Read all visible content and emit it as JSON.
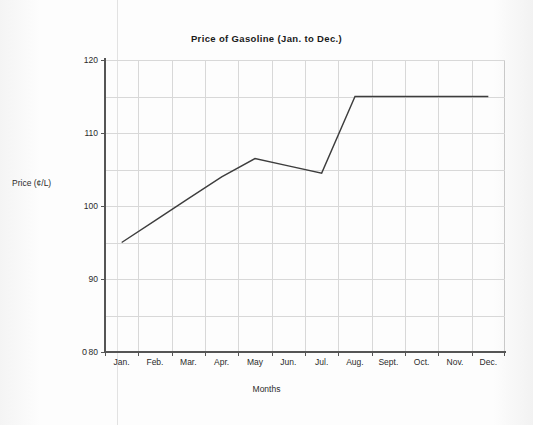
{
  "chart_data": {
    "type": "line",
    "title": "Price of Gasoline (Jan. to Dec.)",
    "xlabel": "Months",
    "ylabel": "Price (¢/L)",
    "categories": [
      "Jan.",
      "Feb.",
      "Mar.",
      "Apr.",
      "May",
      "Jun.",
      "Jul.",
      "Aug.",
      "Sept.",
      "Oct.",
      "Nov.",
      "Dec."
    ],
    "values": [
      95,
      98,
      101,
      104,
      106.5,
      105.5,
      104.5,
      115,
      115,
      115,
      115,
      115
    ],
    "series": [
      {
        "name": "Price of Gasoline",
        "values": [
          95,
          98,
          101,
          104,
          106.5,
          105.5,
          104.5,
          115,
          115,
          115,
          115,
          115
        ]
      }
    ],
    "ylim": [
      80,
      120
    ],
    "y_axis_break_label": "0",
    "y_tick_labels": [
      "120",
      "110",
      "100",
      "90",
      "80"
    ],
    "y_tick_values": [
      120,
      110,
      100,
      90,
      80
    ],
    "y_gridline_values": [
      120,
      115,
      110,
      105,
      100,
      95,
      90,
      85,
      80
    ],
    "y_minor_step": 5,
    "grid": true,
    "legend": "none",
    "line_color": "#3d3d3d",
    "grid_color": "#d8d8d8",
    "axis_color": "#555555",
    "background_color": "#fbfbfb"
  }
}
